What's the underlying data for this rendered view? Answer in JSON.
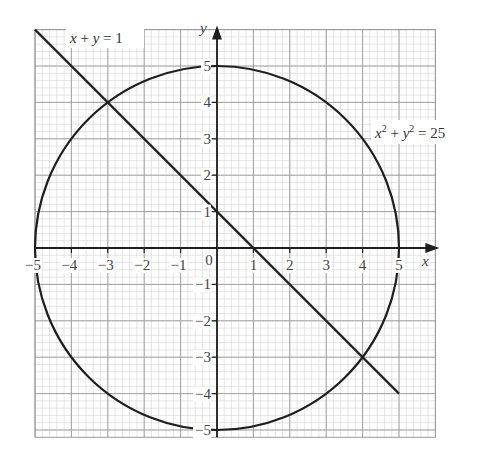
{
  "chart_data": {
    "type": "line",
    "title": "",
    "xlabel": "x",
    "ylabel": "y",
    "xlim": [
      -5,
      6
    ],
    "ylim": [
      -5.2,
      6
    ],
    "grid": true,
    "grid_minor_step": 0.2,
    "x_ticks": [
      -5,
      -4,
      -3,
      -2,
      -1,
      0,
      1,
      2,
      3,
      4,
      5
    ],
    "y_ticks": [
      -5,
      -4,
      -3,
      -2,
      -1,
      1,
      2,
      3,
      4,
      5
    ],
    "x_tick_labels": [
      "−5",
      "−4",
      "−3",
      "−2",
      "−1",
      "0",
      "1",
      "2",
      "3",
      "4",
      "5"
    ],
    "y_tick_labels": [
      "−5",
      "−4",
      "−3",
      "−2",
      "−1",
      "1",
      "2",
      "3",
      "4",
      "5"
    ],
    "origin_label": "0",
    "series": [
      {
        "name": "x + y = 1",
        "kind": "line",
        "points": [
          [
            -5,
            6
          ],
          [
            5,
            -4
          ]
        ]
      },
      {
        "name": "x² + y² = 25",
        "kind": "circle",
        "center": [
          0,
          0
        ],
        "radius": 5
      }
    ],
    "intersections": [
      [
        -3,
        4
      ],
      [
        4,
        -3
      ]
    ],
    "annotations": [
      {
        "text": "x + y = 1",
        "at": [
          -3.9,
          5.6
        ]
      },
      {
        "text": "x² + y² = 25",
        "at": [
          4.3,
          2.9
        ]
      }
    ]
  },
  "labels": {
    "line_eq": {
      "a": "x",
      "op1": " + ",
      "b": "y",
      "rest": " = 1"
    },
    "circle_eq": {
      "a": "x",
      "sa": "2",
      "op1": " + ",
      "b": "y",
      "sb": "2",
      "rest": " = 25"
    },
    "x_axis_name": "x",
    "y_axis_name": "y"
  },
  "colors": {
    "minor_grid": "#d4d4d4",
    "major_grid": "#9a9a9a",
    "curve": "#1e1e1e",
    "axis": "#1e1e1e"
  }
}
